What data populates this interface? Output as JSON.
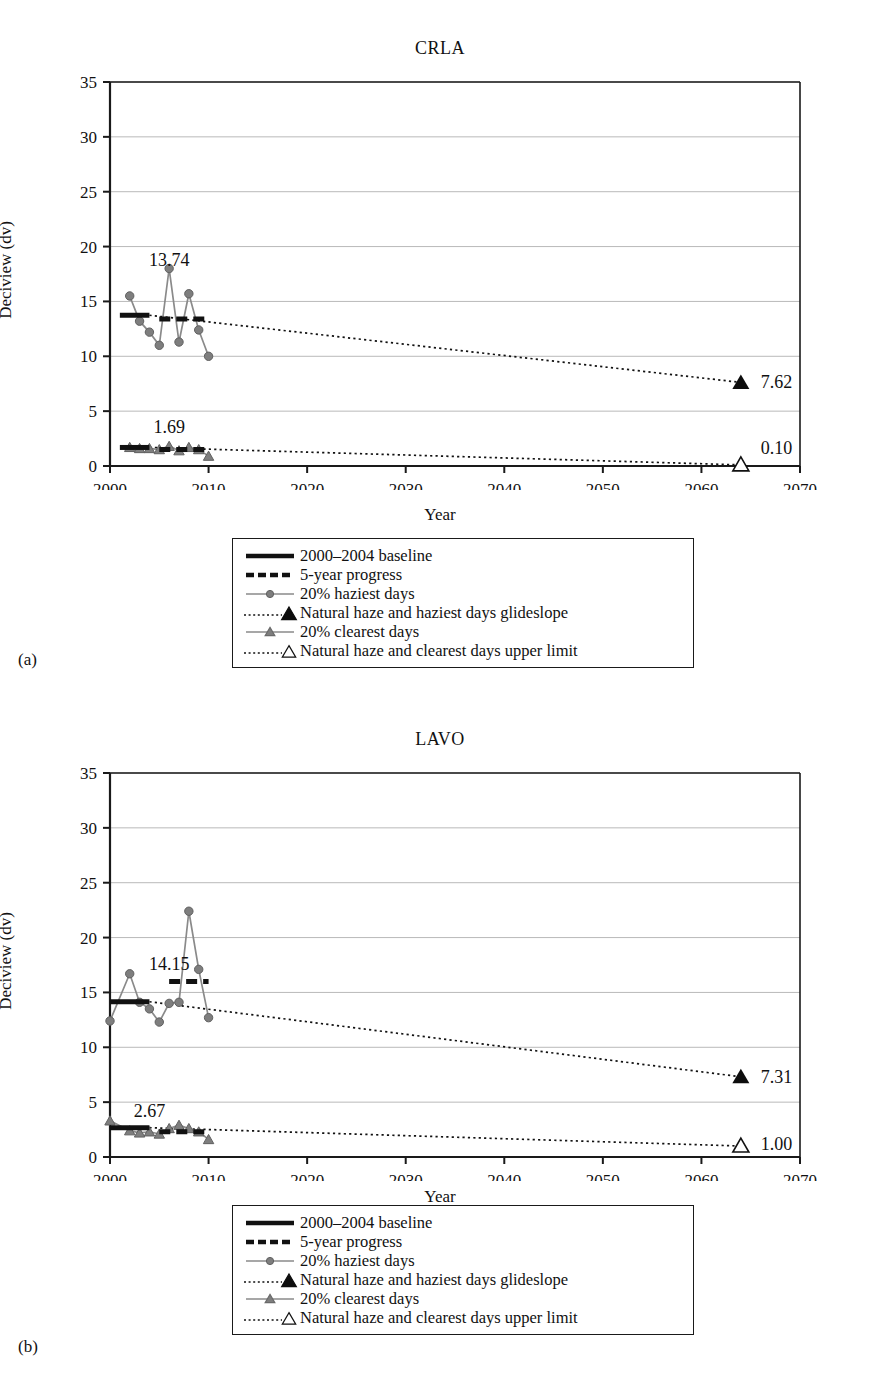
{
  "figure": {
    "panels": [
      {
        "label": "(a)",
        "title": "CRLA",
        "xlabel": "Year",
        "ylabel": "Deciview (dv)",
        "baseline_label": "13.74",
        "clearest_baseline_label": "1.69",
        "haziest_endpoint_label": "7.62",
        "clearest_endpoint_label": "0.10"
      },
      {
        "label": "(b)",
        "title": "LAVO",
        "xlabel": "Year",
        "ylabel": "Deciview (dv)",
        "baseline_label": "14.15",
        "clearest_baseline_label": "2.67",
        "haziest_endpoint_label": "7.31",
        "clearest_endpoint_label": "1.00"
      }
    ],
    "legend": {
      "items": [
        {
          "key": "solid-thick-black-line",
          "label": "2000–2004 baseline"
        },
        {
          "key": "dashed-thick-black-line",
          "label": "5-year progress"
        },
        {
          "key": "gray-line-circle-marker",
          "label": "20% haziest days"
        },
        {
          "key": "dotted-line-filled-triangle",
          "label": "Natural haze and haziest days glideslope"
        },
        {
          "key": "gray-line-triangle-marker",
          "label": "20% clearest days"
        },
        {
          "key": "dotted-line-open-triangle",
          "label": "Natural haze and clearest days upper limit"
        }
      ]
    },
    "colors": {
      "axis": "#1a1a1a",
      "grid": "#b9b9b9",
      "series_gray": "#8a8a8a",
      "marker_gray": "#7e7e7e",
      "baseline_black": "#111111"
    }
  },
  "chart_data": [
    {
      "type": "line",
      "title": "CRLA",
      "xlabel": "Year",
      "ylabel": "Deciview (dv)",
      "xlim": [
        2000,
        2070
      ],
      "ylim": [
        0,
        35
      ],
      "xticks": [
        2000,
        2010,
        2020,
        2030,
        2040,
        2050,
        2060,
        2070
      ],
      "yticks": [
        0,
        5,
        10,
        15,
        20,
        25,
        30,
        35
      ],
      "grid": "horizontal",
      "legend_position": "below-plot",
      "series": [
        {
          "name": "20% haziest days",
          "x": [
            2002,
            2003,
            2004,
            2005,
            2006,
            2007,
            2008,
            2009,
            2010
          ],
          "values": [
            15.5,
            13.2,
            12.2,
            11.0,
            18.0,
            11.3,
            15.7,
            12.4,
            10.0
          ]
        },
        {
          "name": "20% clearest days",
          "x": [
            2002,
            2003,
            2004,
            2005,
            2006,
            2007,
            2008,
            2009,
            2010
          ],
          "values": [
            1.7,
            1.6,
            1.6,
            1.5,
            1.8,
            1.4,
            1.7,
            1.5,
            0.9
          ]
        },
        {
          "name": "2000–2004 baseline (haziest)",
          "x": [
            2001,
            2004
          ],
          "values": [
            13.74,
            13.74
          ]
        },
        {
          "name": "5-year progress (haziest)",
          "x": [
            2005,
            2010
          ],
          "values": [
            13.4,
            13.4
          ]
        },
        {
          "name": "2000–2004 baseline (clearest)",
          "x": [
            2001,
            2004
          ],
          "values": [
            1.69,
            1.69
          ]
        },
        {
          "name": "5-year progress (clearest)",
          "x": [
            2005,
            2010
          ],
          "values": [
            1.5,
            1.5
          ]
        },
        {
          "name": "Natural haze and haziest days glideslope",
          "x": [
            2004,
            2064
          ],
          "values": [
            13.74,
            7.62
          ]
        },
        {
          "name": "Natural haze and clearest days upper limit",
          "x": [
            2004,
            2064
          ],
          "values": [
            1.69,
            0.1
          ]
        }
      ],
      "annotations": [
        {
          "text": "13.74",
          "x": 2006,
          "y": 18.8
        },
        {
          "text": "1.69",
          "x": 2006,
          "y": 3.6
        },
        {
          "text": "7.62",
          "x": 2065,
          "y": 7.62
        },
        {
          "text": "0.10",
          "x": 2065,
          "y": 1.6
        }
      ]
    },
    {
      "type": "line",
      "title": "LAVO",
      "xlabel": "Year",
      "ylabel": "Deciview (dv)",
      "xlim": [
        2000,
        2070
      ],
      "ylim": [
        0,
        35
      ],
      "xticks": [
        2000,
        2010,
        2020,
        2030,
        2040,
        2050,
        2060,
        2070
      ],
      "yticks": [
        0,
        5,
        10,
        15,
        20,
        25,
        30,
        35
      ],
      "grid": "horizontal",
      "legend_position": "below-plot",
      "series": [
        {
          "name": "20% haziest days",
          "x": [
            2000,
            2002,
            2003,
            2004,
            2005,
            2006,
            2007,
            2008,
            2009,
            2010
          ],
          "values": [
            12.4,
            16.7,
            14.1,
            13.5,
            12.3,
            14.0,
            14.1,
            22.4,
            17.1,
            12.7
          ]
        },
        {
          "name": "20% clearest days",
          "x": [
            2000,
            2002,
            2003,
            2004,
            2005,
            2006,
            2007,
            2008,
            2009,
            2010
          ],
          "values": [
            3.3,
            2.4,
            2.2,
            2.3,
            2.1,
            2.6,
            2.9,
            2.6,
            2.3,
            1.6
          ]
        },
        {
          "name": "2000–2004 baseline (haziest)",
          "x": [
            2000,
            2004
          ],
          "values": [
            14.15,
            14.15
          ]
        },
        {
          "name": "5-year progress (haziest)",
          "x": [
            2006,
            2010
          ],
          "values": [
            16.0,
            16.0
          ]
        },
        {
          "name": "2000–2004 baseline (clearest)",
          "x": [
            2000,
            2004
          ],
          "values": [
            2.67,
            2.67
          ]
        },
        {
          "name": "5-year progress (clearest)",
          "x": [
            2005,
            2010
          ],
          "values": [
            2.3,
            2.3
          ]
        },
        {
          "name": "Natural haze and haziest days glideslope",
          "x": [
            2004,
            2064
          ],
          "values": [
            14.15,
            7.31
          ]
        },
        {
          "name": "Natural haze and clearest days upper limit",
          "x": [
            2004,
            2064
          ],
          "values": [
            2.67,
            1.0
          ]
        }
      ],
      "annotations": [
        {
          "text": "14.15",
          "x": 2006,
          "y": 17.6
        },
        {
          "text": "2.67",
          "x": 2004,
          "y": 4.2
        },
        {
          "text": "7.31",
          "x": 2065,
          "y": 7.31
        },
        {
          "text": "1.00",
          "x": 2065,
          "y": 1.2
        }
      ]
    }
  ]
}
